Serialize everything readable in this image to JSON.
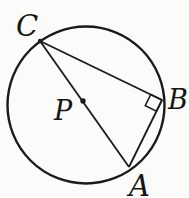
{
  "figure": {
    "colors": {
      "background": "#fbfbf9",
      "stroke": "#1a1a1a",
      "label": "#151515"
    },
    "canvas": {
      "width": 189,
      "height": 198
    },
    "circle": {
      "cx": 86,
      "cy": 105,
      "r": 78.5
    },
    "center": {
      "label": "P",
      "dot_x": 83,
      "dot_y": 101,
      "dot_radius": 2.7,
      "label_x": 54,
      "label_y": 120
    },
    "points": {
      "C": {
        "label": "C",
        "x": 40,
        "y": 41,
        "label_x": 16,
        "label_y": 36
      },
      "B": {
        "label": "B",
        "x": 162,
        "y": 100,
        "label_x": 168,
        "label_y": 109
      },
      "A": {
        "label": "A",
        "x": 129,
        "y": 167,
        "label_x": 129,
        "label_y": 196
      }
    },
    "segments": [
      {
        "id": "segment-c-b",
        "from": "C",
        "to": "B"
      },
      {
        "id": "segment-c-a",
        "from": "C",
        "to": "A"
      },
      {
        "id": "segment-a-b",
        "from": "A",
        "to": "B"
      }
    ],
    "right_angle_marker": {
      "vertex": "B",
      "arm1": "C",
      "arm2": "A",
      "size": 12.5
    }
  }
}
